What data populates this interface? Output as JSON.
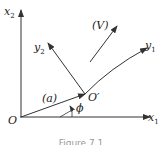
{
  "figure": {
    "caption": "Figure 7.1",
    "labels": {
      "x1": "x",
      "x1_sub": "1",
      "x2": "x",
      "x2_sub": "2",
      "y1": "y",
      "y1_sub": "1",
      "y2": "y",
      "y2_sub": "2",
      "origin": "O",
      "origin_prime": "O′",
      "vector_a": "(a)",
      "vector_v": "(V)",
      "angle": "ϕ"
    },
    "colors": {
      "stroke": "#333333",
      "text": "#222222"
    }
  }
}
